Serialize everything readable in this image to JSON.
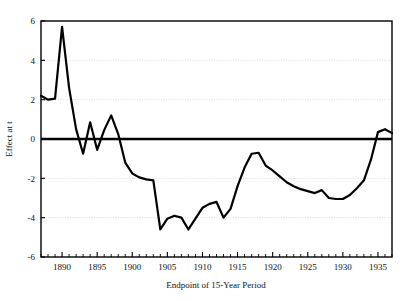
{
  "chart_data": {
    "type": "line",
    "title": "",
    "xlabel": "Endpoint of 15-Year Period",
    "ylabel": "Effect at t",
    "xlim": [
      1887,
      1937
    ],
    "ylim": [
      -6,
      6
    ],
    "xticks": [
      1890,
      1895,
      1900,
      1905,
      1910,
      1915,
      1920,
      1925,
      1930,
      1935
    ],
    "xtick_labels": [
      "1890",
      "1895",
      "1900",
      "1905",
      "1910",
      "1915",
      "1920",
      "1925",
      "1930",
      "1935"
    ],
    "yticks": [
      -6,
      -4,
      -2,
      0,
      2,
      4,
      6
    ],
    "ytick_labels": [
      "-6",
      "-4",
      "-2",
      "0",
      "2",
      "4",
      "6"
    ],
    "minor_xtick_step": 1,
    "grid": "horizontal-dotted-light",
    "gridlines_at": [
      4,
      2,
      -2,
      -4
    ],
    "zero_reference_line": 0,
    "legend": "none",
    "line_color": "#000000",
    "series": [
      {
        "name": "Effect at t",
        "x": [
          1887,
          1888,
          1889,
          1890,
          1891,
          1892,
          1893,
          1894,
          1895,
          1896,
          1897,
          1898,
          1899,
          1900,
          1901,
          1902,
          1903,
          1904,
          1905,
          1906,
          1907,
          1908,
          1909,
          1910,
          1911,
          1912,
          1913,
          1914,
          1915,
          1916,
          1917,
          1918,
          1919,
          1920,
          1921,
          1922,
          1923,
          1924,
          1925,
          1926,
          1927,
          1928,
          1929,
          1930,
          1931,
          1932,
          1933,
          1934,
          1935,
          1936,
          1937
        ],
        "values": [
          2.2,
          2.0,
          2.05,
          5.7,
          2.6,
          0.5,
          -0.75,
          0.85,
          -0.55,
          0.45,
          1.2,
          0.25,
          -1.2,
          -1.75,
          -1.95,
          -2.05,
          -2.1,
          -4.6,
          -4.05,
          -3.9,
          -4.0,
          -4.6,
          -4.05,
          -3.5,
          -3.3,
          -3.2,
          -4.0,
          -3.55,
          -2.4,
          -1.45,
          -0.75,
          -0.7,
          -1.35,
          -1.6,
          -1.9,
          -2.2,
          -2.4,
          -2.55,
          -2.65,
          -2.75,
          -2.6,
          -3.0,
          -3.05,
          -3.05,
          -2.85,
          -2.5,
          -2.1,
          -1.05,
          0.35,
          0.5,
          0.3
        ]
      }
    ]
  },
  "axes": {
    "y_title": "Effect at t",
    "x_title": "Endpoint of 15-Year Period"
  }
}
